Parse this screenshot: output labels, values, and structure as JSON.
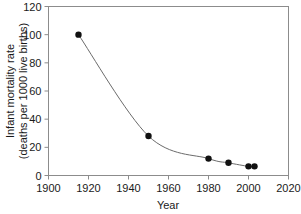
{
  "chart_data": {
    "type": "scatter",
    "title": "",
    "xlabel": "Year",
    "ylabel": "Infant mortality rate",
    "ylabel_line2": "(deaths per 1000 live births)",
    "xlim": [
      1900,
      2020
    ],
    "ylim": [
      0,
      120
    ],
    "xticks": [
      1900,
      1920,
      1940,
      1960,
      1980,
      2000,
      2020
    ],
    "yticks": [
      0,
      20,
      40,
      60,
      80,
      100,
      120
    ],
    "xtick_labels": [
      "1900",
      "1920",
      "1940",
      "1960",
      "1980",
      "2000",
      "2020"
    ],
    "ytick_labels": [
      "0",
      "20",
      "40",
      "60",
      "80",
      "100",
      "120"
    ],
    "grid": false,
    "legend": "none",
    "series": [
      {
        "name": "Infant mortality rate",
        "marker": "filled-circle",
        "marker_color": "#111111",
        "line_color": "#6b6b6b",
        "line_style": "smooth",
        "x": [
          1915,
          1950,
          1980,
          1990,
          2000,
          2003
        ],
        "y": [
          100,
          28,
          12,
          9,
          6.5,
          6.5
        ]
      }
    ],
    "colors": {
      "frame": "#8c8c8c",
      "marker": "#111111",
      "line": "#6b6b6b",
      "text": "#1a1a1a",
      "background": "#ffffff"
    }
  }
}
